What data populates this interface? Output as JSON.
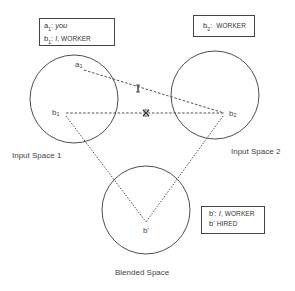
{
  "diagram": {
    "type": "conceptual-blending-network",
    "spaces": [
      {
        "id": "input1",
        "label": "Input Space 1",
        "cx": 74,
        "cy": 99,
        "r": 44
      },
      {
        "id": "input2",
        "label": "Input Space 2",
        "cx": 215,
        "cy": 95,
        "r": 44
      },
      {
        "id": "blend",
        "label": "Blended Space",
        "cx": 146,
        "cy": 210,
        "r": 44
      }
    ],
    "points": {
      "a1": {
        "base": "a",
        "sub": "1",
        "x": 77,
        "y": 68
      },
      "b1": {
        "base": "b",
        "sub": "1",
        "x": 61,
        "y": 114
      },
      "b2": {
        "base": "b",
        "sub": "2",
        "x": 224,
        "y": 113
      },
      "bprime": {
        "label": "b'",
        "x": 146,
        "y": 222
      }
    },
    "mappings": [
      {
        "from": "a1",
        "to": "b2",
        "style": "dashed",
        "mark": "I"
      },
      {
        "from": "b1",
        "to": "b2",
        "style": "dashed",
        "mark": "X"
      },
      {
        "from": "b1",
        "to": "bprime",
        "style": "dotted"
      },
      {
        "from": "b2",
        "to": "bprime",
        "style": "dotted"
      }
    ],
    "marks": {
      "cross_a": "I",
      "cross_b": "X"
    },
    "boxes": {
      "input1": {
        "rows": [
          {
            "key": "a",
            "sub": "1",
            "sep": ":",
            "value": "you",
            "value_style": "italic"
          },
          {
            "key": "b",
            "sub": "1",
            "sep": ":",
            "value_italic": "I",
            "value": ", WORKER"
          }
        ]
      },
      "input2": {
        "rows": [
          {
            "key": "b",
            "sub": "2",
            "sep": ":",
            "value": "WORKER"
          }
        ]
      },
      "blend": {
        "rows": [
          {
            "key": "b'",
            "sep": ":",
            "value_italic": "I",
            "value": ", WORKER"
          },
          {
            "key": "b'",
            "sep": "",
            "value": "HIRED"
          }
        ]
      }
    },
    "colors": {
      "stroke": "#3a3a3a",
      "text": "#333333",
      "background": "#ffffff"
    }
  }
}
